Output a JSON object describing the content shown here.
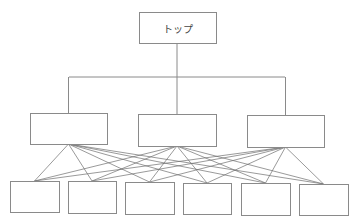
{
  "diagram": {
    "caption": "",
    "colors": {
      "stroke": "#8a8a8a",
      "fan_stroke": "#6e6e6e",
      "fill": "#ffffff",
      "text": "#444444"
    },
    "top": {
      "label": "トップ",
      "x": 139,
      "y": 12,
      "w": 77,
      "h": 31
    },
    "bus": {
      "y": 77,
      "x1": 69,
      "x2": 285,
      "stem_x": 177
    },
    "middle": [
      {
        "label": "",
        "x": 30,
        "y": 113,
        "w": 77,
        "h": 31
      },
      {
        "label": "",
        "x": 138,
        "y": 114,
        "w": 78,
        "h": 32
      },
      {
        "label": "",
        "x": 247,
        "y": 115,
        "w": 77,
        "h": 32
      }
    ],
    "bottom": [
      {
        "label": "",
        "x": 10,
        "y": 181,
        "w": 49,
        "h": 31
      },
      {
        "label": "",
        "x": 68,
        "y": 181,
        "w": 48,
        "h": 32
      },
      {
        "label": "",
        "x": 125,
        "y": 182,
        "w": 49,
        "h": 32
      },
      {
        "label": "",
        "x": 183,
        "y": 183,
        "w": 48,
        "h": 31
      },
      {
        "label": "",
        "x": 241,
        "y": 183,
        "w": 49,
        "h": 32
      },
      {
        "label": "",
        "x": 299,
        "y": 184,
        "w": 49,
        "h": 31
      }
    ]
  }
}
